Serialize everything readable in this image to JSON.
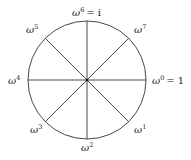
{
  "diagram": {
    "type": "roots-of-unity-circle",
    "center": [
      87,
      80
    ],
    "radius": 59,
    "stroke_color": "#333333",
    "spokes": 8,
    "labels": [
      {
        "id": "w0",
        "base": "ω",
        "exp": "0",
        "suffix": "= 1",
        "x": 152,
        "y": 84
      },
      {
        "id": "w1",
        "base": "ω",
        "exp": "1",
        "suffix": "",
        "x": 134,
        "y": 133
      },
      {
        "id": "w2",
        "base": "ω",
        "exp": "2",
        "suffix": "",
        "x": 81,
        "y": 151
      },
      {
        "id": "w3",
        "base": "ω",
        "exp": "3",
        "suffix": "",
        "x": 30,
        "y": 133
      },
      {
        "id": "w4",
        "base": "ω",
        "exp": "4",
        "suffix": "",
        "x": 8,
        "y": 84
      },
      {
        "id": "w5",
        "base": "ω",
        "exp": "5",
        "suffix": "",
        "x": 26,
        "y": 33
      },
      {
        "id": "w6",
        "base": "ω",
        "exp": "6",
        "suffix": "= i",
        "x": 72,
        "y": 16
      },
      {
        "id": "w7",
        "base": "ω",
        "exp": "7",
        "suffix": "",
        "x": 134,
        "y": 33
      }
    ]
  }
}
